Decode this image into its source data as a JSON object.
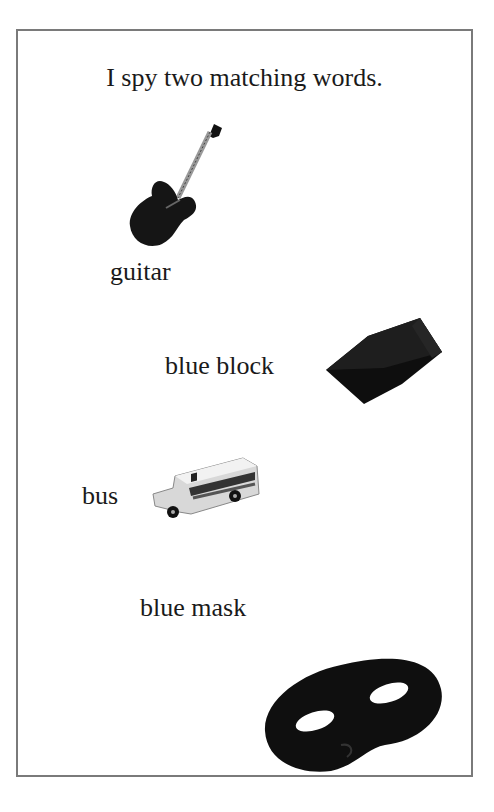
{
  "title": "I spy two matching words.",
  "items": [
    {
      "word": "guitar",
      "icon": "guitar-icon"
    },
    {
      "word": "blue block",
      "icon": "block-icon"
    },
    {
      "word": "bus",
      "icon": "bus-icon"
    },
    {
      "word": "blue mask",
      "icon": "mask-icon"
    }
  ],
  "colors": {
    "border": "#7a7a7a",
    "object": "#111111"
  }
}
